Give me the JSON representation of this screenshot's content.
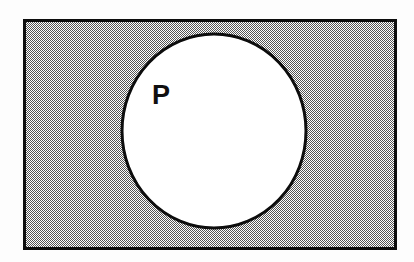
{
  "figure": {
    "type": "venn-diagram",
    "width": 414,
    "height": 262,
    "background_color": "#fdfdfd"
  },
  "universal_set": {
    "name": "universal-set-rectangle",
    "shape": "rectangle",
    "label": "",
    "fill_color": "#a8a8a8",
    "fill_pattern": "50% checkerboard dither (black and white pixels)",
    "border_color": "#000000",
    "border_width": 3,
    "x": 23,
    "y": 19,
    "width": 374,
    "height": 231
  },
  "sets": [
    {
      "name": "set-p",
      "label": "P",
      "shape": "ellipse",
      "fill_color": "#ffffff",
      "stroke_color": "#0a0a0a",
      "stroke_width": 3,
      "center_x": 214,
      "center_y": 131,
      "radius_x": 92,
      "radius_y": 97,
      "label_x": 152,
      "label_y": 104,
      "label_color": "#101010",
      "label_font_size": 27,
      "label_font_weight": "bold"
    }
  ],
  "regions": [
    {
      "name": "inside-p",
      "description": "White interior of circle P",
      "shading": "white"
    },
    {
      "name": "outside-p-inside-universal",
      "description": "Shaded gray region of the universal set outside P (complement of P)",
      "shading": "gray-dither"
    }
  ]
}
